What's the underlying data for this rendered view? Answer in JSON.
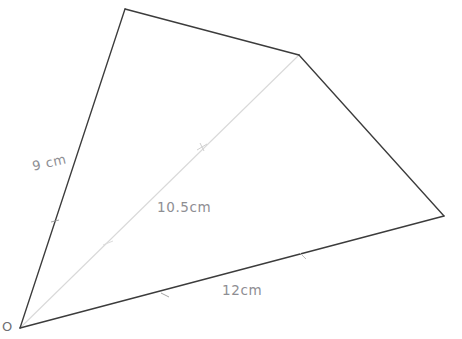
{
  "figure": {
    "kind": "quadrilateral-with-diagonal",
    "background_color": "#ffffff",
    "outline_color": "#3c3c3c",
    "diagonal_color": "#d9d9d9",
    "label_color": "#8e8e93",
    "vertices": [
      {
        "name": "O",
        "x": 20,
        "y": 328
      },
      {
        "name": "top",
        "x": 125,
        "y": 9
      },
      {
        "name": "upper-right",
        "x": 299,
        "y": 55
      },
      {
        "name": "right",
        "x": 444,
        "y": 216
      }
    ],
    "edges": [
      {
        "name": "left-side",
        "from": "O",
        "to": "top",
        "measure": "9 cm"
      },
      {
        "name": "top-side",
        "from": "top",
        "to": "upper-right",
        "measure": ""
      },
      {
        "name": "right-side",
        "from": "upper-right",
        "to": "right",
        "measure": ""
      },
      {
        "name": "bottom-side",
        "from": "right",
        "to": "O",
        "measure": "12cm"
      }
    ],
    "diagonal": {
      "name": "diagonal",
      "from": "O",
      "to": "upper-right",
      "measure": "10.5cm"
    },
    "tick_marks": [
      {
        "name": "tick-diagonal-lower",
        "x": 108,
        "y": 243
      },
      {
        "name": "tick-diagonal-upper",
        "x": 202,
        "y": 147
      },
      {
        "name": "tick-bottom-side",
        "x": 165,
        "y": 295
      },
      {
        "name": "tick-left-side",
        "x": 55,
        "y": 221
      },
      {
        "name": "tick-right-side",
        "x": 303,
        "y": 256
      }
    ]
  },
  "labels": {
    "side_left": "9 cm",
    "diagonal": "10.5cm",
    "side_bottom": "12cm",
    "vertex_origin": "O"
  }
}
